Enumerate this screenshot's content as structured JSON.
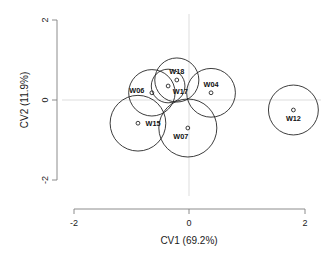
{
  "chart_data": {
    "type": "scatter",
    "title": "",
    "xlabel": "CV1 (69.2%)",
    "ylabel": "CV2 (11.9%)",
    "xlim": [
      -2.2,
      2.2
    ],
    "ylim": [
      -2.4,
      2.1
    ],
    "xticks": [
      -2,
      0,
      2
    ],
    "xtick_labels": [
      "-2",
      "0",
      "2"
    ],
    "yticks": [
      -2,
      0,
      2
    ],
    "ytick_labels": [
      "-2",
      "0",
      "2"
    ],
    "grid": false,
    "reference_lines": {
      "x": 0,
      "y": 0
    },
    "marker": "open-circle",
    "confidence_circles": true,
    "legend": null,
    "points": [
      {
        "label": "W06",
        "x": -0.64,
        "y": 0.18,
        "r": 0.4,
        "label_dx": -0.26,
        "label_dy": 0.06
      },
      {
        "label": "W18",
        "x": -0.21,
        "y": 0.5,
        "r": 0.38,
        "label_dx": 0.0,
        "label_dy": 0.21
      },
      {
        "label": "W17",
        "x": -0.36,
        "y": 0.35,
        "r": 0.29,
        "label_dx": 0.21,
        "label_dy": -0.13
      },
      {
        "label": "W04",
        "x": 0.38,
        "y": 0.18,
        "r": 0.42,
        "label_dx": 0.0,
        "label_dy": 0.22
      },
      {
        "label": "W15",
        "x": -0.88,
        "y": -0.58,
        "r": 0.48,
        "label_dx": 0.26,
        "label_dy": 0.0
      },
      {
        "label": "W07",
        "x": -0.02,
        "y": -0.7,
        "r": 0.5,
        "label_dx": -0.12,
        "label_dy": -0.22
      },
      {
        "label": "W12",
        "x": 1.8,
        "y": -0.25,
        "r": 0.43,
        "label_dx": 0.0,
        "label_dy": -0.21
      }
    ]
  },
  "axes": {
    "x_title": "CV1 (69.2%)",
    "y_title": "CV2 (11.9%)",
    "x_tick_labels": [
      "-2",
      "0",
      "2"
    ],
    "y_tick_labels": [
      "-2",
      "0",
      "2"
    ]
  },
  "colors": {
    "background": "#ffffff",
    "bubble_stroke": "#1a1a1a",
    "axis": "#808080",
    "reference": "#d9d9d9",
    "text": "#1a1a1a"
  }
}
